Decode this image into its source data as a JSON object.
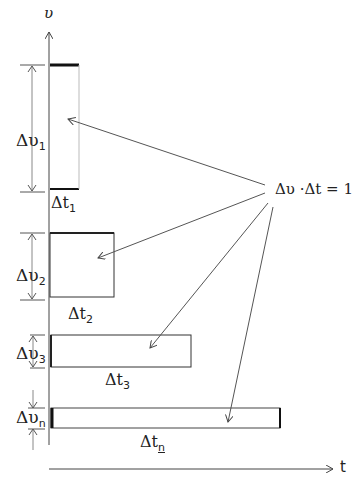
{
  "axes": {
    "y_label": "υ",
    "x_label": "t"
  },
  "equation": "Δυ ·Δt = 1",
  "rectangles": [
    {
      "dv_label": "Δυ",
      "dv_sub": "1",
      "dt_label": "Δt",
      "dt_sub": "1"
    },
    {
      "dv_label": "Δυ",
      "dv_sub": "2",
      "dt_label": "Δt",
      "dt_sub": "2"
    },
    {
      "dv_label": "Δυ",
      "dv_sub": "3",
      "dt_label": "Δt",
      "dt_sub": "3"
    },
    {
      "dv_label": "Δυ",
      "dv_sub": "n",
      "dt_label": "Δt",
      "dt_sub": "n"
    }
  ]
}
